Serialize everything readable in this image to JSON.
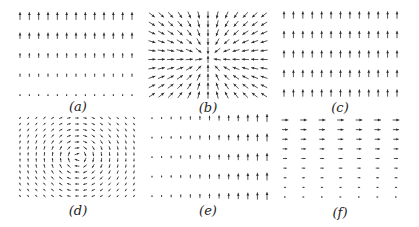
{
  "figure": {
    "arrow_color": "#2a2a2a",
    "background": "#ffffff"
  },
  "panels": [
    {
      "id": "a",
      "label": "(a)",
      "field": "uniform-up-decreasing-downward",
      "grid": {
        "cols": 13,
        "rows": 5,
        "x0": 20,
        "x1": 132,
        "y0": 16,
        "y1": 95
      },
      "label_pos": {
        "x": 78,
        "y": 99
      }
    },
    {
      "id": "b",
      "label": "(b)",
      "field": "radial-sink",
      "grid": {
        "cols": 13,
        "rows": 10,
        "x0": 152,
        "x1": 264,
        "y0": 15,
        "y1": 95
      },
      "center": {
        "x": 208,
        "y": 58
      },
      "label_pos": {
        "x": 208,
        "y": 100
      }
    },
    {
      "id": "c",
      "label": "(c)",
      "field": "uniform-up",
      "grid": {
        "cols": 13,
        "rows": 5,
        "x0": 284,
        "x1": 397,
        "y0": 15,
        "y1": 93
      },
      "label_pos": {
        "x": 340,
        "y": 100
      }
    },
    {
      "id": "d",
      "label": "(d)",
      "field": "rotational-vortex",
      "grid": {
        "cols": 15,
        "rows": 14,
        "x0": 20,
        "x1": 134,
        "y0": 118,
        "y1": 196
      },
      "center": {
        "x": 78,
        "y": 157
      },
      "label_pos": {
        "x": 78,
        "y": 203
      }
    },
    {
      "id": "e",
      "label": "(e)",
      "field": "up-increasing-rightward",
      "grid": {
        "cols": 13,
        "rows": 5,
        "x0": 152,
        "x1": 267,
        "y0": 118,
        "y1": 196
      },
      "label_pos": {
        "x": 208,
        "y": 203
      }
    },
    {
      "id": "f",
      "label": "(f)",
      "field": "horizontal-decreasing-downward",
      "grid": {
        "cols": 7,
        "rows": 9,
        "x0": 285,
        "x1": 396,
        "y0": 120,
        "y1": 197
      },
      "label_pos": {
        "x": 340,
        "y": 205
      }
    }
  ]
}
